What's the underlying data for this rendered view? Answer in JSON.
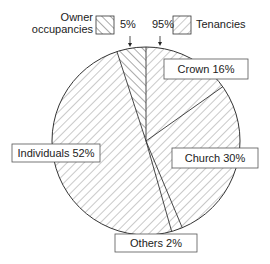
{
  "chart_data": {
    "type": "pie",
    "title": "",
    "legend": {
      "placement": "top",
      "entries": [
        {
          "name": "Owner occupancies",
          "line1": "Owner",
          "line2": "occupancies",
          "hatch": "back-diagonal",
          "percent_label": "5%"
        },
        {
          "name": "Tenancies",
          "hatch": "forward-diagonal",
          "percent_label": "95%"
        }
      ]
    },
    "top_split": [
      {
        "name": "Owner occupancies",
        "value": 5
      },
      {
        "name": "Tenancies",
        "value": 95
      }
    ],
    "tenancy_breakdown": [
      {
        "name": "Crown",
        "value": 16,
        "label": "Crown 16%"
      },
      {
        "name": "Church",
        "value": 30,
        "label": "Church 30%"
      },
      {
        "name": "Others",
        "value": 2,
        "label": "Others 2%"
      },
      {
        "name": "Individuals",
        "value": 52,
        "label": "Individuals 52%"
      }
    ],
    "colors": {
      "stroke": "#333333",
      "hatch": "#777777",
      "background": "#ffffff"
    }
  }
}
